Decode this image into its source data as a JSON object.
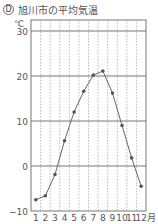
{
  "header": {
    "badge": "D",
    "title": "旭川市の平均気温"
  },
  "chart_data": {
    "type": "line",
    "title": "旭川市の平均気温",
    "ylabel": "℃",
    "xlabel": "月",
    "categories": [
      "1",
      "2",
      "3",
      "4",
      "5",
      "6",
      "7",
      "8",
      "9",
      "10",
      "11",
      "12"
    ],
    "series": [
      {
        "name": "平均気温",
        "values": [
          -7.5,
          -6.6,
          -1.9,
          5.6,
          12.0,
          16.6,
          20.2,
          21.1,
          16.2,
          9.0,
          1.8,
          -4.5
        ]
      }
    ],
    "ylim": [
      -10,
      32
    ],
    "yticks": [
      -10,
      0,
      10,
      20,
      30
    ],
    "ytick_labels": [
      "−10",
      "0",
      "10",
      "20",
      "30"
    ],
    "x_unit_label": "月",
    "grid": {
      "horizontal": "solid at 10° intervals",
      "vertical": "dotted per month"
    },
    "legend": "none"
  }
}
